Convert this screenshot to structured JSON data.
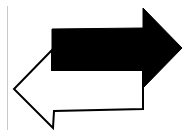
{
  "diagram": {
    "divider": {
      "color": "#c8c8c8"
    },
    "arrows": [
      {
        "name": "right-arrow",
        "direction": "right",
        "fill": "#000000",
        "stroke": "#000000",
        "points": "52,29 143,28 143,8 182,48 143,88 143,70 52,70"
      },
      {
        "name": "left-arrow",
        "direction": "left",
        "fill": "#ffffff",
        "stroke": "#000000",
        "points": "143,70 143,109 54,111 53,128 14,89 52,50 52,70"
      }
    ]
  }
}
